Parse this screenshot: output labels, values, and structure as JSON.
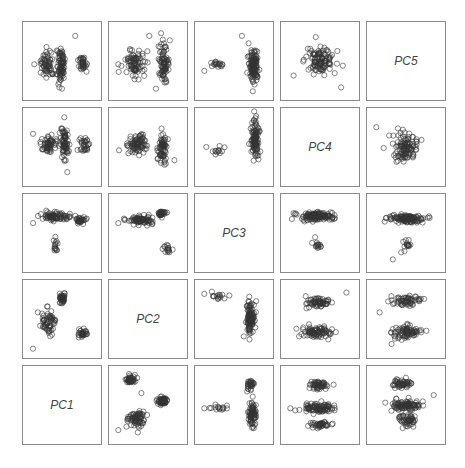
{
  "chart_data": {
    "type": "scatter",
    "title": "",
    "layout": "scatterplot matrix 5x5, diagonal holds variable labels (anti-diagonal from bottom-left to top-right)",
    "variables": [
      "PC1",
      "PC2",
      "PC3",
      "PC4",
      "PC5"
    ],
    "grid": false,
    "marker": "open circle",
    "marker_color": "#333333",
    "diagonal_labels": [
      {
        "row": 0,
        "col": 4,
        "label": "PC5"
      },
      {
        "row": 1,
        "col": 3,
        "label": "PC4"
      },
      {
        "row": 2,
        "col": 2,
        "label": "PC3"
      },
      {
        "row": 3,
        "col": 1,
        "label": "PC2"
      },
      {
        "row": 4,
        "col": 0,
        "label": "PC1"
      }
    ],
    "panels": [
      {
        "row": 0,
        "col": 0,
        "clusters": [
          [
            0.28,
            0.55,
            0.1,
            0.2,
            60
          ],
          [
            0.48,
            0.55,
            0.06,
            0.28,
            80
          ],
          [
            0.82,
            0.55,
            0.07,
            0.15,
            35
          ]
        ],
        "outliers": [
          [
            0.08,
            0.55
          ],
          [
            0.7,
            0.12
          ],
          [
            0.5,
            0.92
          ]
        ]
      },
      {
        "row": 0,
        "col": 1,
        "clusters": [
          [
            0.3,
            0.55,
            0.14,
            0.2,
            80
          ],
          [
            0.74,
            0.52,
            0.08,
            0.26,
            80
          ]
        ],
        "outliers": [
          [
            0.05,
            0.55
          ],
          [
            0.52,
            0.12
          ],
          [
            0.62,
            0.92
          ]
        ]
      },
      {
        "row": 0,
        "col": 2,
        "clusters": [
          [
            0.25,
            0.55,
            0.12,
            0.07,
            18
          ],
          [
            0.8,
            0.55,
            0.07,
            0.25,
            120
          ]
        ],
        "outliers": [
          [
            0.05,
            0.65
          ],
          [
            0.62,
            0.12
          ]
        ]
      },
      {
        "row": 0,
        "col": 3,
        "clusters": [
          [
            0.5,
            0.5,
            0.22,
            0.18,
            110
          ]
        ],
        "outliers": [
          [
            0.1,
            0.72
          ],
          [
            0.82,
            0.9
          ]
        ]
      },
      {
        "row": 1,
        "col": 0,
        "clusters": [
          [
            0.3,
            0.45,
            0.12,
            0.15,
            60
          ],
          [
            0.54,
            0.45,
            0.06,
            0.28,
            70
          ],
          [
            0.84,
            0.48,
            0.08,
            0.12,
            30
          ]
        ],
        "outliers": [
          [
            0.06,
            0.3
          ],
          [
            0.58,
            0.88
          ]
        ]
      },
      {
        "row": 1,
        "col": 1,
        "clusters": [
          [
            0.32,
            0.45,
            0.14,
            0.15,
            80
          ],
          [
            0.72,
            0.5,
            0.07,
            0.25,
            70
          ]
        ],
        "outliers": [
          [
            0.06,
            0.55
          ],
          [
            0.9,
            0.7
          ]
        ]
      },
      {
        "row": 1,
        "col": 2,
        "clusters": [
          [
            0.28,
            0.55,
            0.14,
            0.08,
            12
          ],
          [
            0.82,
            0.4,
            0.06,
            0.28,
            100
          ]
        ],
        "outliers": [
          [
            0.08,
            0.5
          ]
        ]
      },
      {
        "row": 1,
        "col": 4,
        "clusters": [
          [
            0.5,
            0.5,
            0.18,
            0.2,
            110
          ]
        ],
        "outliers": [
          [
            0.05,
            0.2
          ]
        ]
      },
      {
        "row": 2,
        "col": 0,
        "clusters": [
          [
            0.4,
            0.25,
            0.22,
            0.06,
            80
          ],
          [
            0.78,
            0.3,
            0.07,
            0.05,
            30
          ],
          [
            0.4,
            0.7,
            0.04,
            0.12,
            15
          ]
        ],
        "outliers": [
          [
            0.06,
            0.35
          ]
        ]
      },
      {
        "row": 2,
        "col": 1,
        "clusters": [
          [
            0.4,
            0.3,
            0.2,
            0.06,
            80
          ],
          [
            0.7,
            0.2,
            0.06,
            0.05,
            30
          ],
          [
            0.8,
            0.75,
            0.07,
            0.1,
            15
          ]
        ],
        "outliers": [
          [
            0.05,
            0.35
          ]
        ]
      },
      {
        "row": 2,
        "col": 3,
        "clusters": [
          [
            0.45,
            0.25,
            0.25,
            0.06,
            120
          ],
          [
            0.45,
            0.65,
            0.06,
            0.1,
            15
          ]
        ],
        "outliers": [
          [
            0.1,
            0.2
          ]
        ]
      },
      {
        "row": 2,
        "col": 4,
        "clusters": [
          [
            0.5,
            0.28,
            0.25,
            0.06,
            120
          ],
          [
            0.5,
            0.7,
            0.06,
            0.1,
            15
          ]
        ],
        "outliers": [
          [
            0.3,
            0.9
          ]
        ]
      },
      {
        "row": 3,
        "col": 0,
        "clusters": [
          [
            0.3,
            0.55,
            0.1,
            0.2,
            60
          ],
          [
            0.5,
            0.2,
            0.06,
            0.1,
            40
          ],
          [
            0.82,
            0.72,
            0.07,
            0.06,
            30
          ]
        ],
        "outliers": [
          [
            0.06,
            0.95
          ]
        ]
      },
      {
        "row": 3,
        "col": 1,
        "clusters": [],
        "outliers": []
      },
      {
        "row": 3,
        "col": 2,
        "clusters": [
          [
            0.28,
            0.15,
            0.14,
            0.06,
            15
          ],
          [
            0.75,
            0.5,
            0.06,
            0.25,
            110
          ]
        ],
        "outliers": [
          [
            0.05,
            0.12
          ]
        ]
      },
      {
        "row": 3,
        "col": 3,
        "clusters": [
          [
            0.45,
            0.25,
            0.22,
            0.08,
            60
          ],
          [
            0.45,
            0.7,
            0.22,
            0.08,
            80
          ]
        ],
        "outliers": [
          [
            0.9,
            0.1
          ]
        ]
      },
      {
        "row": 3,
        "col": 4,
        "clusters": [
          [
            0.5,
            0.22,
            0.22,
            0.08,
            60
          ],
          [
            0.5,
            0.7,
            0.22,
            0.1,
            80
          ]
        ],
        "outliers": [
          [
            0.1,
            0.4
          ]
        ]
      },
      {
        "row": 4,
        "col": 1,
        "clusters": [
          [
            0.22,
            0.12,
            0.07,
            0.06,
            40
          ],
          [
            0.72,
            0.44,
            0.08,
            0.06,
            60
          ],
          [
            0.32,
            0.7,
            0.14,
            0.12,
            70
          ]
        ],
        "outliers": [
          [
            0.05,
            0.88
          ],
          [
            0.4,
            0.32
          ]
        ]
      },
      {
        "row": 4,
        "col": 2,
        "clusters": [
          [
            0.25,
            0.55,
            0.12,
            0.05,
            15
          ],
          [
            0.75,
            0.2,
            0.05,
            0.1,
            30
          ],
          [
            0.78,
            0.65,
            0.06,
            0.18,
            80
          ]
        ],
        "outliers": [
          [
            0.05,
            0.55
          ]
        ]
      },
      {
        "row": 4,
        "col": 3,
        "clusters": [
          [
            0.5,
            0.2,
            0.16,
            0.06,
            50
          ],
          [
            0.45,
            0.55,
            0.22,
            0.07,
            90
          ],
          [
            0.5,
            0.8,
            0.15,
            0.06,
            40
          ]
        ],
        "outliers": [
          [
            0.05,
            0.55
          ]
        ]
      },
      {
        "row": 4,
        "col": 4,
        "clusters": [
          [
            0.45,
            0.18,
            0.16,
            0.06,
            50
          ],
          [
            0.5,
            0.5,
            0.22,
            0.08,
            90
          ],
          [
            0.55,
            0.72,
            0.15,
            0.08,
            50
          ]
        ],
        "outliers": [
          [
            0.92,
            0.35
          ],
          [
            0.45,
            0.85
          ]
        ]
      }
    ]
  }
}
